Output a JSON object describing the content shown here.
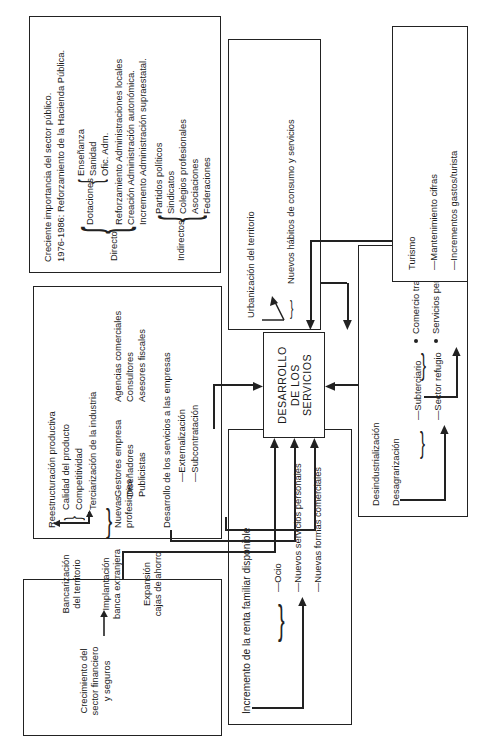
{
  "diagram": {
    "title": "Desarrollo de los servicios",
    "type": "flowchart",
    "orientation": "rotated-90-ccw",
    "center": {
      "line1": "DESARROLLO",
      "line2": "DE LOS",
      "line3": "SERVICIOS"
    },
    "boxes": {
      "financiero": {
        "name": "sector-financiero",
        "items": [
          "Crecimiento del\nsector financiero\ny seguros",
          "Bancarización\ndel territorio",
          "Implantación\nbanca extranjera",
          "Expansión\ncajas de ahorro"
        ],
        "l1": "Crecimiento del",
        "l2": "sector financiero",
        "l3": "y seguros",
        "r1": "Bancarización",
        "r2": "del territorio",
        "r3": "Implantación",
        "r4": "banca extranjera",
        "r5": "Expansión",
        "r6": "cajas de ahorro"
      },
      "industria": {
        "name": "reestructuracion-productiva",
        "head": "Reestructuración productiva",
        "b1": "Calidad del producto",
        "b2": "Competitividad",
        "arrowto": "Terciarización de la industria",
        "prof_label1": "Nuevas",
        "prof_label2": "profesiones",
        "prof": [
          "Gestores empresa",
          "Diseñadores",
          "Publicistas",
          "Agencias comerciales",
          "Consultores",
          "Asesores fiscales"
        ],
        "dev": "Desarrollo de los servicios a las empresas",
        "dev1": "—Externalización",
        "dev2": "—Subcontratación"
      },
      "publico": {
        "name": "sector-publico",
        "head1": "Creciente importancia del sector público.",
        "head2": "1976-1986: Reforzamiento de la Hacienda Pública.",
        "directo_label": "Directo",
        "dotaciones_label": "Dotaciones",
        "dotaciones": [
          "Enseñanza",
          "Sanidad",
          "Ofic. Adm."
        ],
        "directo": [
          "Reforzamiento Administraciones locales",
          "Creación Administración autonómica.",
          "Incremento Administración supraestatal."
        ],
        "indirectos_label": "Indirectos",
        "indirectos": [
          "Partidos políticos",
          "Sindicatos",
          "Colegios profesionales",
          "Asociaciones",
          "Federaciones"
        ]
      },
      "renta": {
        "name": "renta-familiar",
        "head": "Incremento de la renta familiar disponible",
        "items": [
          "—Ocio",
          "—Nuevos servicios personales",
          "—Nuevas formas comerciales"
        ]
      },
      "desindustrializacion": {
        "name": "desindustrializacion",
        "head1": "Desindustrialización",
        "head2": "Desagrarización",
        "items": [
          "—Subterciario",
          "—Sector refugio"
        ],
        "bullets": [
          "Comercio tradicional",
          "Servicios personales tradicionales"
        ]
      },
      "urbanizacion": {
        "name": "urbanizacion-territorio",
        "head": "Urbanización del territorio",
        "item": "Nuevos hábitos de consumo y servicios"
      },
      "turismo": {
        "name": "turismo",
        "head": "Turismo",
        "items": [
          "—Mantenimiento cifras",
          "—Incrementos gastos/turista"
        ]
      }
    }
  }
}
